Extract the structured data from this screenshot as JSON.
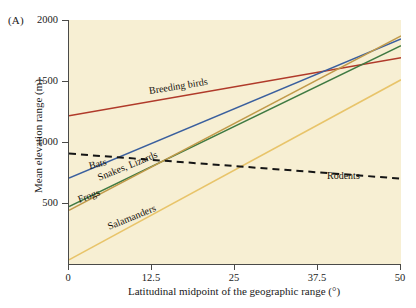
{
  "figure": {
    "panel_label": "(A)",
    "background_color": "#f7efd3",
    "axis_color": "#4a4a48"
  },
  "chart_data": {
    "type": "line",
    "title": "",
    "subtitle": "",
    "xlabel": "Latitudinal midpoint of the geographic range (°)",
    "ylabel": "Mean elevation range (m)",
    "xlim": [
      0,
      50
    ],
    "ylim": [
      0,
      2000
    ],
    "xticks": [
      0,
      12.5,
      25,
      37.5,
      50
    ],
    "xtick_labels": [
      "0",
      "12.5",
      "25",
      "37.5",
      "50"
    ],
    "yticks": [
      500,
      1000,
      1500,
      2000
    ],
    "ytick_labels": [
      "500",
      "1000",
      "1500",
      "2000"
    ],
    "grid": false,
    "legend_position": "inline-annotations",
    "series": [
      {
        "name": "Breeding birds",
        "label": "Breeding birds",
        "color": "#b03a2a",
        "style": "solid",
        "x": [
          0,
          50
        ],
        "values": [
          1215,
          1690
        ],
        "label_x": 12.2,
        "label_y": 1415,
        "label_angle": -9
      },
      {
        "name": "Bats",
        "label": "Bats",
        "color": "#3a5f9e",
        "style": "solid",
        "x": [
          0,
          50
        ],
        "values": [
          705,
          1845
        ],
        "label_x": 3.2,
        "label_y": 800,
        "label_angle": -13
      },
      {
        "name": "Snakes, Lizards",
        "label": "Snakes, Lizards",
        "color": "#3f7a42",
        "style": "solid",
        "x": [
          0,
          50
        ],
        "values": [
          470,
          1790
        ],
        "label_x": 4.5,
        "label_y": 705,
        "label_angle": -22
      },
      {
        "name": "Frogs",
        "label": "Frogs",
        "color": "#c19a4a",
        "style": "solid",
        "x": [
          0,
          50
        ],
        "values": [
          440,
          1870
        ],
        "label_x": 1.5,
        "label_y": 525,
        "label_angle": -20
      },
      {
        "name": "Salamanders",
        "label": "Salamanders",
        "color": "#e8c46a",
        "style": "solid",
        "x": [
          0,
          50
        ],
        "values": [
          35,
          1510
        ],
        "label_x": 6.0,
        "label_y": 300,
        "label_angle": -22
      },
      {
        "name": "Rodents",
        "label": "Rodents",
        "color": "#151515",
        "style": "dashed",
        "x": [
          0,
          50
        ],
        "values": [
          905,
          700
        ],
        "label_x": 39.0,
        "label_y": 725,
        "label_angle": 0
      }
    ]
  }
}
